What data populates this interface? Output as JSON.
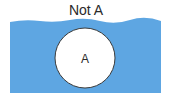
{
  "diagram": {
    "title": "Not A",
    "set_label": "A",
    "colors": {
      "universe_fill": "#5ea6e2",
      "circle_fill": "#ffffff",
      "circle_stroke": "#3a3a3a"
    }
  }
}
